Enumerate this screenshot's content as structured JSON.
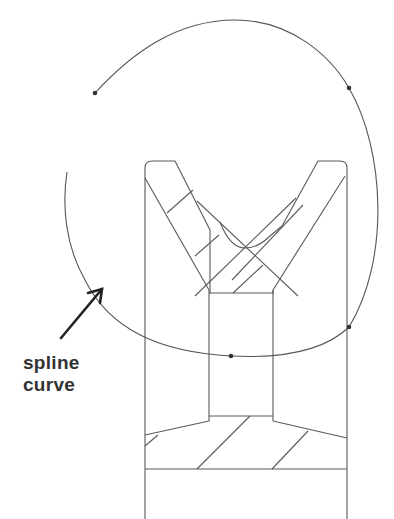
{
  "diagram": {
    "annotation": {
      "lines": [
        "spline",
        "curve"
      ]
    },
    "colors": {
      "line": "#555555",
      "arrow": "#222222",
      "text": "#333333",
      "background": "#ffffff"
    },
    "control_point_count": 5
  }
}
